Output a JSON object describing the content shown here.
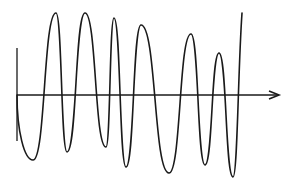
{
  "figure": {
    "description": "Oscillating waveform with varying frequency and amplitude crossing a horizontal time axis with an arrow",
    "width": 293,
    "height": 185
  },
  "colors": {
    "background": "#ffffff",
    "stroke": "#1a1a1a"
  },
  "axes": {
    "horizontal": {
      "x1": 17,
      "y": 95,
      "x2": 279,
      "arrow": true
    },
    "vertical": {
      "x": 17,
      "y1": 48,
      "y2": 141
    }
  },
  "waveform": {
    "start": [
      17,
      95
    ],
    "extrema": [
      {
        "type": "trough",
        "x": 33,
        "y": 160
      },
      {
        "type": "peak",
        "x": 56,
        "y": 13
      },
      {
        "type": "trough",
        "x": 67,
        "y": 152
      },
      {
        "type": "peak",
        "x": 85,
        "y": 13
      },
      {
        "type": "trough",
        "x": 106,
        "y": 147
      },
      {
        "type": "peak",
        "x": 114,
        "y": 18
      },
      {
        "type": "trough",
        "x": 126,
        "y": 167
      },
      {
        "type": "peak",
        "x": 141,
        "y": 25
      },
      {
        "type": "trough",
        "x": 169,
        "y": 173
      },
      {
        "type": "peak",
        "x": 191,
        "y": 34
      },
      {
        "type": "trough",
        "x": 205,
        "y": 165
      },
      {
        "type": "peak",
        "x": 219,
        "y": 53
      },
      {
        "type": "trough",
        "x": 233,
        "y": 177
      }
    ],
    "end": [
      242,
      13
    ],
    "zero_crossings_x": [
      17,
      50,
      62,
      72,
      100,
      111,
      118,
      132,
      150,
      186,
      200,
      210,
      229,
      236
    ]
  }
}
